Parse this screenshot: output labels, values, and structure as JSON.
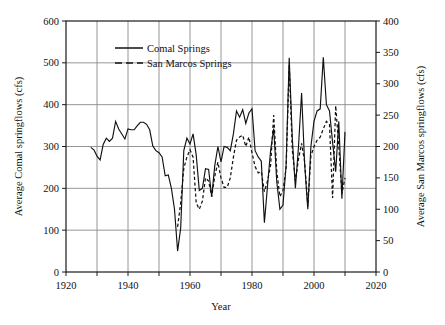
{
  "chart_data": {
    "type": "line",
    "title": "",
    "subtitle": "",
    "xlabel": "Year",
    "ylabel": "Average Comal springflows (cfs)",
    "y2label": "Average San Marcos springflows (cfs)",
    "xlim": [
      1920,
      2020
    ],
    "ylim": [
      0,
      600
    ],
    "y2lim": [
      0,
      400
    ],
    "xticks": [
      1920,
      1930,
      1940,
      1950,
      1960,
      1970,
      1980,
      1990,
      2000,
      2010,
      2020
    ],
    "xtick_labels": [
      "1920",
      "",
      "1940",
      "",
      "1960",
      "",
      "1980",
      "",
      "2000",
      "",
      "2020"
    ],
    "xtick_labels_major": [
      "1920",
      "1940",
      "1960",
      "1980",
      "2000",
      "2020"
    ],
    "yticks": [
      0,
      100,
      200,
      300,
      400,
      500,
      600
    ],
    "ytick_labels": [
      "0",
      "100",
      "200",
      "300",
      "400",
      "500",
      "600"
    ],
    "y2ticks": [
      0,
      50,
      100,
      150,
      200,
      250,
      300,
      350,
      400
    ],
    "y2tick_labels": [
      "0",
      "50",
      "100",
      "150",
      "200",
      "250",
      "300",
      "350",
      "400"
    ],
    "grid": true,
    "grid_x_at": [
      1930,
      1940,
      1950,
      1960,
      1970,
      1980,
      1990,
      2000,
      2010
    ],
    "grid_y_at": [
      100,
      200,
      300,
      400,
      500
    ],
    "legend_position": "upper-left-inside",
    "line_color": "#111111",
    "grid_color": "#8a8a8a",
    "axis_color": "#1a1a1a",
    "background": "#ffffff",
    "series": [
      {
        "name": "Comal Springs",
        "style": "solid",
        "axis": "left",
        "units": "cfs",
        "x": [
          1928,
          1929,
          1930,
          1931,
          1932,
          1933,
          1934,
          1935,
          1936,
          1937,
          1938,
          1939,
          1940,
          1941,
          1942,
          1943,
          1944,
          1945,
          1946,
          1947,
          1948,
          1949,
          1950,
          1951,
          1952,
          1953,
          1954,
          1955,
          1956,
          1957,
          1958,
          1959,
          1960,
          1961,
          1962,
          1963,
          1964,
          1965,
          1966,
          1967,
          1968,
          1969,
          1970,
          1971,
          1972,
          1973,
          1974,
          1975,
          1976,
          1977,
          1978,
          1979,
          1980,
          1981,
          1982,
          1983,
          1984,
          1985,
          1986,
          1987,
          1988,
          1989,
          1990,
          1991,
          1992,
          1993,
          1994,
          1995,
          1996,
          1997,
          1998,
          1999,
          2000,
          2001,
          2002,
          2003,
          2004,
          2005,
          2006,
          2007,
          2008,
          2009,
          2010
        ],
        "values": [
          298,
          292,
          277,
          268,
          305,
          320,
          312,
          320,
          360,
          342,
          330,
          318,
          342,
          340,
          340,
          350,
          358,
          358,
          353,
          340,
          301,
          290,
          285,
          275,
          230,
          232,
          200,
          150,
          50,
          105,
          290,
          320,
          306,
          330,
          280,
          195,
          200,
          247,
          245,
          180,
          255,
          300,
          263,
          300,
          298,
          290,
          330,
          385,
          370,
          388,
          355,
          380,
          390,
          290,
          275,
          265,
          118,
          205,
          290,
          343,
          215,
          150,
          160,
          255,
          512,
          320,
          200,
          300,
          428,
          255,
          150,
          300,
          360,
          385,
          390,
          513,
          400,
          385,
          310,
          240,
          360,
          175,
          335
        ],
        "label_first_year": 1928,
        "label_last_year": 2010
      },
      {
        "name": "San Marcos Springs",
        "style": "dashed",
        "axis": "right",
        "units": "cfs",
        "x": [
          1956,
          1957,
          1958,
          1959,
          1960,
          1961,
          1962,
          1963,
          1964,
          1965,
          1966,
          1967,
          1968,
          1969,
          1970,
          1971,
          1972,
          1973,
          1974,
          1975,
          1976,
          1977,
          1978,
          1979,
          1980,
          1981,
          1982,
          1983,
          1984,
          1985,
          1986,
          1987,
          1988,
          1989,
          1990,
          1991,
          1992,
          1993,
          1994,
          1995,
          1996,
          1997,
          1998,
          1999,
          2000,
          2001,
          2002,
          2003,
          2004,
          2005,
          2006,
          2007,
          2008,
          2009,
          2010
        ],
        "values": [
          72,
          110,
          165,
          183,
          195,
          183,
          110,
          100,
          113,
          150,
          145,
          120,
          153,
          175,
          150,
          135,
          135,
          150,
          183,
          210,
          215,
          218,
          200,
          215,
          190,
          168,
          158,
          160,
          128,
          145,
          170,
          250,
          160,
          120,
          130,
          165,
          330,
          195,
          145,
          180,
          205,
          175,
          105,
          185,
          200,
          210,
          215,
          228,
          240,
          235,
          118,
          265,
          200,
          125,
          150
        ],
        "label_first_year": 1956,
        "label_last_year": 2010
      }
    ]
  },
  "legend": {
    "entries": [
      {
        "label": "Comal Springs",
        "style": "solid"
      },
      {
        "label": "San Marcos Springs",
        "style": "dashed"
      }
    ]
  }
}
